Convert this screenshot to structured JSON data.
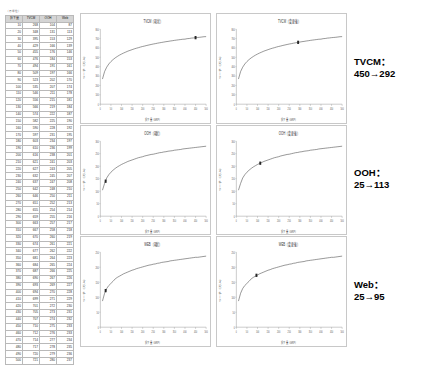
{
  "table": {
    "caption": "（万単位）",
    "headers": [
      "投下量",
      "TVCM",
      "OOH",
      "Web"
    ],
    "rows": [
      [
        10,
        268,
        104,
        87
      ],
      [
        20,
        348,
        131,
        113
      ],
      [
        30,
        395,
        153,
        129
      ],
      [
        40,
        429,
        166,
        139
      ],
      [
        50,
        455,
        176,
        146
      ],
      [
        60,
        476,
        184,
        153
      ],
      [
        70,
        494,
        191,
        161
      ],
      [
        80,
        509,
        197,
        166
      ],
      [
        90,
        523,
        202,
        170
      ],
      [
        100,
        535,
        207,
        174
      ],
      [
        110,
        546,
        211,
        178
      ],
      [
        120,
        556,
        215,
        181
      ],
      [
        130,
        566,
        219,
        184
      ],
      [
        140,
        574,
        222,
        187
      ],
      [
        150,
        582,
        225,
        190
      ],
      [
        160,
        590,
        228,
        192
      ],
      [
        170,
        597,
        231,
        195
      ],
      [
        180,
        603,
        234,
        197
      ],
      [
        190,
        610,
        236,
        199
      ],
      [
        200,
        616,
        238,
        201
      ],
      [
        210,
        621,
        241,
        203
      ],
      [
        220,
        627,
        243,
        205
      ],
      [
        230,
        632,
        245,
        207
      ],
      [
        240,
        637,
        247,
        208
      ],
      [
        250,
        642,
        248,
        210
      ],
      [
        260,
        646,
        250,
        211
      ],
      [
        270,
        651,
        252,
        213
      ],
      [
        280,
        655,
        254,
        214
      ],
      [
        290,
        659,
        255,
        216
      ],
      [
        300,
        663,
        257,
        217
      ],
      [
        310,
        667,
        258,
        218
      ],
      [
        320,
        670,
        260,
        219
      ],
      [
        330,
        674,
        261,
        221
      ],
      [
        340,
        677,
        262,
        222
      ],
      [
        350,
        681,
        264,
        223
      ],
      [
        360,
        684,
        265,
        224
      ],
      [
        370,
        687,
        266,
        225
      ],
      [
        380,
        690,
        267,
        226
      ],
      [
        390,
        693,
        269,
        227
      ],
      [
        400,
        694,
        270,
        228
      ],
      [
        410,
        699,
        271,
        229
      ],
      [
        420,
        701,
        272,
        230
      ],
      [
        430,
        705,
        273,
        231
      ],
      [
        440,
        707,
        274,
        232
      ],
      [
        450,
        710,
        275,
        233
      ],
      [
        460,
        712,
        276,
        233
      ],
      [
        470,
        714,
        277,
        234
      ],
      [
        480,
        717,
        278,
        235
      ],
      [
        490,
        720,
        279,
        236
      ],
      [
        500,
        721,
        280,
        237
      ]
    ]
  },
  "notes": [
    {
      "label": "TVCM：",
      "value": "450→292"
    },
    {
      "label": "OOH：",
      "value": "25→113"
    },
    {
      "label": "Web：",
      "value": "25→95"
    }
  ],
  "chart_data": [
    {
      "id": "tvcm-left",
      "type": "line",
      "title": "TVCM（現状）",
      "xlabel": "投下量（GRP）",
      "ylabel": "リーチ（万人）",
      "xlim": [
        0,
        500
      ],
      "ylim": [
        0,
        800
      ],
      "xticks": [
        0,
        50,
        100,
        150,
        200,
        250,
        300,
        350,
        400,
        450,
        500
      ],
      "yticks": [
        0,
        100,
        200,
        300,
        400,
        500,
        600,
        700,
        800
      ],
      "grid": false,
      "legend": "none",
      "series": [
        {
          "name": "TVCM",
          "x": [
            10,
            20,
            30,
            40,
            50,
            60,
            70,
            80,
            90,
            100,
            110,
            120,
            130,
            140,
            150,
            160,
            170,
            180,
            190,
            200,
            210,
            220,
            230,
            240,
            250,
            260,
            270,
            280,
            290,
            300,
            310,
            320,
            330,
            340,
            350,
            360,
            370,
            380,
            390,
            400,
            410,
            420,
            430,
            440,
            450,
            460,
            470,
            480,
            490,
            500
          ],
          "values": [
            268,
            348,
            395,
            429,
            455,
            476,
            494,
            509,
            523,
            535,
            546,
            556,
            566,
            574,
            582,
            590,
            597,
            603,
            610,
            616,
            621,
            627,
            632,
            637,
            642,
            646,
            651,
            655,
            659,
            663,
            667,
            670,
            674,
            677,
            681,
            684,
            687,
            690,
            693,
            694,
            699,
            701,
            705,
            707,
            710,
            712,
            714,
            717,
            720,
            721
          ]
        }
      ],
      "marker": {
        "x": 450,
        "y": 710,
        "label": "現状"
      }
    },
    {
      "id": "tvcm-right",
      "type": "line",
      "title": "TVCM（変更後）",
      "xlabel": "投下量（GRP）",
      "ylabel": "リーチ（万人）",
      "xlim": [
        0,
        500
      ],
      "ylim": [
        0,
        800
      ],
      "xticks": [
        0,
        50,
        100,
        150,
        200,
        250,
        300,
        350,
        400,
        450,
        500
      ],
      "yticks": [
        0,
        100,
        200,
        300,
        400,
        500,
        600,
        700,
        800
      ],
      "grid": false,
      "legend": "none",
      "series": [
        {
          "name": "TVCM",
          "x": [
            10,
            20,
            30,
            40,
            50,
            60,
            70,
            80,
            90,
            100,
            110,
            120,
            130,
            140,
            150,
            160,
            170,
            180,
            190,
            200,
            210,
            220,
            230,
            240,
            250,
            260,
            270,
            280,
            290,
            300,
            310,
            320,
            330,
            340,
            350,
            360,
            370,
            380,
            390,
            400,
            410,
            420,
            430,
            440,
            450,
            460,
            470,
            480,
            490,
            500
          ],
          "values": [
            268,
            348,
            395,
            429,
            455,
            476,
            494,
            509,
            523,
            535,
            546,
            556,
            566,
            574,
            582,
            590,
            597,
            603,
            610,
            616,
            621,
            627,
            632,
            637,
            642,
            646,
            651,
            655,
            659,
            663,
            667,
            670,
            674,
            677,
            681,
            684,
            687,
            690,
            693,
            694,
            699,
            701,
            705,
            707,
            710,
            712,
            714,
            717,
            720,
            721
          ]
        }
      ],
      "marker": {
        "x": 292,
        "y": 660,
        "label": "変更後"
      }
    },
    {
      "id": "ooh-left",
      "type": "line",
      "title": "OOH（現状）",
      "xlabel": "投下量（GRP）",
      "ylabel": "リーチ（万人）",
      "xlim": [
        0,
        500
      ],
      "ylim": [
        0,
        300
      ],
      "xticks": [
        0,
        50,
        100,
        150,
        200,
        250,
        300,
        350,
        400,
        450,
        500
      ],
      "yticks": [
        0,
        50,
        100,
        150,
        200,
        250,
        300
      ],
      "grid": false,
      "legend": "none",
      "series": [
        {
          "name": "OOH",
          "x": [
            10,
            20,
            30,
            40,
            50,
            60,
            70,
            80,
            90,
            100,
            110,
            120,
            130,
            140,
            150,
            160,
            170,
            180,
            190,
            200,
            210,
            220,
            230,
            240,
            250,
            260,
            270,
            280,
            290,
            300,
            310,
            320,
            330,
            340,
            350,
            360,
            370,
            380,
            390,
            400,
            410,
            420,
            430,
            440,
            450,
            460,
            470,
            480,
            490,
            500
          ],
          "values": [
            104,
            131,
            153,
            166,
            176,
            184,
            191,
            197,
            202,
            207,
            211,
            215,
            219,
            222,
            225,
            228,
            231,
            234,
            236,
            238,
            241,
            243,
            245,
            247,
            248,
            250,
            252,
            254,
            255,
            257,
            258,
            260,
            261,
            262,
            264,
            265,
            266,
            267,
            269,
            270,
            271,
            272,
            273,
            274,
            275,
            276,
            277,
            278,
            279,
            280
          ]
        }
      ],
      "marker": {
        "x": 25,
        "y": 140,
        "label": "現状"
      }
    },
    {
      "id": "ooh-right",
      "type": "line",
      "title": "OOH（変更後）",
      "xlabel": "投下量（GRP）",
      "ylabel": "リーチ（万人）",
      "xlim": [
        0,
        500
      ],
      "ylim": [
        0,
        300
      ],
      "xticks": [
        0,
        50,
        100,
        150,
        200,
        250,
        300,
        350,
        400,
        450,
        500
      ],
      "yticks": [
        0,
        50,
        100,
        150,
        200,
        250,
        300
      ],
      "grid": false,
      "legend": "none",
      "series": [
        {
          "name": "OOH",
          "x": [
            10,
            20,
            30,
            40,
            50,
            60,
            70,
            80,
            90,
            100,
            110,
            120,
            130,
            140,
            150,
            160,
            170,
            180,
            190,
            200,
            210,
            220,
            230,
            240,
            250,
            260,
            270,
            280,
            290,
            300,
            310,
            320,
            330,
            340,
            350,
            360,
            370,
            380,
            390,
            400,
            410,
            420,
            430,
            440,
            450,
            460,
            470,
            480,
            490,
            500
          ],
          "values": [
            104,
            131,
            153,
            166,
            176,
            184,
            191,
            197,
            202,
            207,
            211,
            215,
            219,
            222,
            225,
            228,
            231,
            234,
            236,
            238,
            241,
            243,
            245,
            247,
            248,
            250,
            252,
            254,
            255,
            257,
            258,
            260,
            261,
            262,
            264,
            265,
            266,
            267,
            269,
            270,
            271,
            272,
            273,
            274,
            275,
            276,
            277,
            278,
            279,
            280
          ]
        }
      ],
      "marker": {
        "x": 113,
        "y": 212,
        "label": "変更後"
      }
    },
    {
      "id": "web-left",
      "type": "line",
      "title": "WEB（現状）",
      "xlabel": "投下量（GRP）",
      "ylabel": "リーチ（万人）",
      "xlim": [
        0,
        500
      ],
      "ylim": [
        0,
        250
      ],
      "xticks": [
        0,
        50,
        100,
        150,
        200,
        250,
        300,
        350,
        400,
        450,
        500
      ],
      "yticks": [
        0,
        50,
        100,
        150,
        200,
        250
      ],
      "grid": false,
      "legend": "none",
      "series": [
        {
          "name": "Web",
          "x": [
            10,
            20,
            30,
            40,
            50,
            60,
            70,
            80,
            90,
            100,
            110,
            120,
            130,
            140,
            150,
            160,
            170,
            180,
            190,
            200,
            210,
            220,
            230,
            240,
            250,
            260,
            270,
            280,
            290,
            300,
            310,
            320,
            330,
            340,
            350,
            360,
            370,
            380,
            390,
            400,
            410,
            420,
            430,
            440,
            450,
            460,
            470,
            480,
            490,
            500
          ],
          "values": [
            87,
            113,
            129,
            139,
            146,
            153,
            161,
            166,
            170,
            174,
            178,
            181,
            184,
            187,
            190,
            192,
            195,
            197,
            199,
            201,
            203,
            205,
            207,
            208,
            210,
            211,
            213,
            214,
            216,
            217,
            218,
            219,
            221,
            222,
            223,
            224,
            225,
            226,
            227,
            228,
            229,
            230,
            231,
            232,
            233,
            233,
            234,
            235,
            236,
            237
          ]
        }
      ],
      "marker": {
        "x": 25,
        "y": 122,
        "label": "現状"
      }
    },
    {
      "id": "web-right",
      "type": "line",
      "title": "WEB（変更後）",
      "xlabel": "投下量（GRP）",
      "ylabel": "リーチ（万人）",
      "xlim": [
        0,
        500
      ],
      "ylim": [
        0,
        250
      ],
      "xticks": [
        0,
        50,
        100,
        150,
        200,
        250,
        300,
        350,
        400,
        450,
        500
      ],
      "yticks": [
        0,
        50,
        100,
        150,
        200,
        250
      ],
      "grid": false,
      "legend": "none",
      "series": [
        {
          "name": "Web",
          "x": [
            10,
            20,
            30,
            40,
            50,
            60,
            70,
            80,
            90,
            100,
            110,
            120,
            130,
            140,
            150,
            160,
            170,
            180,
            190,
            200,
            210,
            220,
            230,
            240,
            250,
            260,
            270,
            280,
            290,
            300,
            310,
            320,
            330,
            340,
            350,
            360,
            370,
            380,
            390,
            400,
            410,
            420,
            430,
            440,
            450,
            460,
            470,
            480,
            490,
            500
          ],
          "values": [
            87,
            113,
            129,
            139,
            146,
            153,
            161,
            166,
            170,
            174,
            178,
            181,
            184,
            187,
            190,
            192,
            195,
            197,
            199,
            201,
            203,
            205,
            207,
            208,
            210,
            211,
            213,
            214,
            216,
            217,
            218,
            219,
            221,
            222,
            223,
            224,
            225,
            226,
            227,
            228,
            229,
            230,
            231,
            232,
            233,
            233,
            234,
            235,
            236,
            237
          ]
        }
      ],
      "marker": {
        "x": 95,
        "y": 173,
        "label": "変更後"
      }
    }
  ]
}
